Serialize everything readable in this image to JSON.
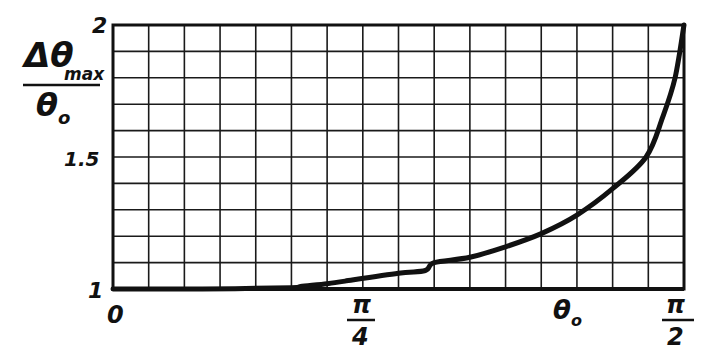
{
  "chart_data": {
    "type": "line",
    "title": "",
    "ylabel": {
      "numerator": "Δθ",
      "subscript": "max",
      "denominator": "θ",
      "denominator_sub": "o"
    },
    "xlabel": {
      "symbol": "θ",
      "subscript": "o"
    },
    "x_ticks": [
      {
        "value": 0,
        "label": "0"
      },
      {
        "value": 0.7854,
        "label_num": "π",
        "label_den": "4"
      },
      {
        "value": 1.5708,
        "label_num": "π",
        "label_den": "2"
      }
    ],
    "y_ticks": [
      {
        "value": 1,
        "label": "1"
      },
      {
        "value": 1.5,
        "label": "1.5"
      },
      {
        "value": 2,
        "label": "2"
      }
    ],
    "xlim": [
      0,
      1.5708
    ],
    "ylim": [
      1,
      2
    ],
    "grid": {
      "on": true,
      "x_divisions": 16,
      "y_divisions": 10
    },
    "series": [
      {
        "name": "Δθmax/θo",
        "x": [
          0,
          0.2454,
          0.4909,
          0.5154,
          0.589,
          0.6381,
          0.7854,
          0.859,
          0.8836,
          0.9817,
          1.0799,
          1.1781,
          1.2763,
          1.3744,
          1.4665,
          1.5119,
          1.5462,
          1.5708
        ],
        "y": [
          1.0,
          1.0,
          1.005,
          1.01,
          1.02,
          1.03,
          1.06,
          1.07,
          1.1,
          1.12,
          1.16,
          1.21,
          1.28,
          1.38,
          1.5,
          1.65,
          1.8,
          2.0
        ]
      }
    ]
  },
  "labels": {
    "y_num": "Δθ",
    "y_sub": "max",
    "y_den": "θ",
    "y_den_sub": "o",
    "y_tick_2": "2",
    "y_tick_15": "1.5",
    "y_tick_1": "1",
    "x_tick_0": "0",
    "x_tick_pi": "π",
    "x_tick_4": "4",
    "x_tick_2": "2",
    "x_label": "θ",
    "x_label_sub": "o"
  },
  "colors": {
    "ink": "#111111",
    "background": "#ffffff"
  }
}
